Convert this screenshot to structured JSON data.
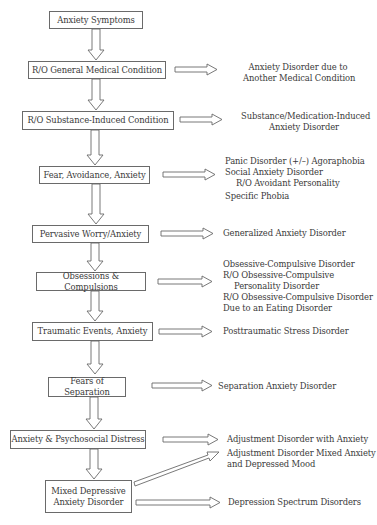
{
  "diagram": {
    "steps": [
      {
        "label": "Anxiety Symptoms"
      },
      {
        "label": "R/O General Medical Condition",
        "outcomes": [
          "Anxiety Disorder due to",
          "Another Medical Condition"
        ]
      },
      {
        "label": "R/O Substance-Induced Condition",
        "outcomes": [
          "Substance/Medication-Induced",
          "Anxiety Disorder"
        ]
      },
      {
        "label": "Fear, Avoidance, Anxiety",
        "outcomes": [
          "Panic Disorder (+/–) Agoraphobia",
          "Social Anxiety Disorder",
          "R/O Avoidant Personality",
          "Specific Phobia"
        ]
      },
      {
        "label": "Pervasive Worry/Anxiety",
        "outcomes": [
          "Generalized Anxiety Disorder"
        ]
      },
      {
        "label": "Obsessions & Compulsions",
        "outcomes": [
          "Obsessive-Compulsive Disorder",
          "R/O Obsessive-Compulsive",
          "Personality Disorder",
          "R/O Obsessive-Compulsive Disorder",
          "Due to an Eating Disorder"
        ]
      },
      {
        "label": "Traumatic Events, Anxiety",
        "outcomes": [
          "Posttraumatic Stress Disorder"
        ]
      },
      {
        "label": "Fears of Separation",
        "outcomes": [
          "Separation Anxiety Disorder"
        ]
      },
      {
        "label": "Anxiety & Psychosocial Distress",
        "outcomes": [
          "Adjustment Disorder with Anxiety"
        ]
      },
      {
        "label_line1": "Mixed Depressive",
        "label_line2": "Anxiety Disorder",
        "outcomes": [
          "Adjustment Disorder Mixed Anxiety",
          "and Depressed Mood",
          "Depression Spectrum Disorders"
        ]
      }
    ]
  }
}
